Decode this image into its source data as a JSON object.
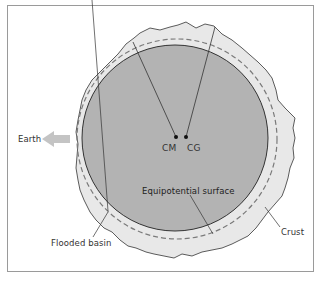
{
  "figure": {
    "labels": {
      "earth": "Earth",
      "cm": "CM",
      "cg": "CG",
      "equipotential": "Equipotential surface",
      "crust": "Crust",
      "flooded_basin": "Flooded basin"
    },
    "icons": {
      "earth_direction": "left-arrow-icon"
    },
    "colors": {
      "mantle_fill": "#b3b3b3",
      "crust_fill": "#e8e8e8",
      "outline": "#333333",
      "dashed": "#7a7a7a",
      "arrow": "#c4c4c4",
      "frame": "#9a9a9a"
    }
  }
}
